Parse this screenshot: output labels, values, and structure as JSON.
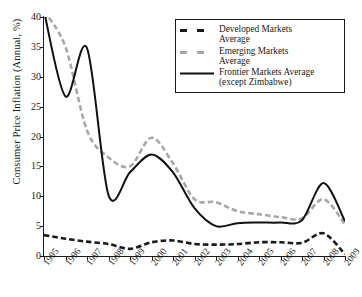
{
  "chart_data": {
    "type": "line",
    "title": "",
    "xlabel": "",
    "ylabel": "Consumer Price Inflation (Annual, %)",
    "grid": false,
    "legend_position": "top-right",
    "xlim": [
      1995,
      2009
    ],
    "ylim": [
      0,
      40
    ],
    "yticks": [
      0,
      5,
      10,
      15,
      20,
      25,
      30,
      35,
      40
    ],
    "categories": [
      "1995",
      "1996",
      "1997",
      "1998",
      "1999",
      "2000",
      "2001",
      "2002",
      "2003",
      "2004",
      "2005",
      "2006",
      "2007",
      "2008",
      "2009"
    ],
    "x": [
      1995,
      1996,
      1997,
      1998,
      1999,
      2000,
      2001,
      2002,
      2003,
      2004,
      2005,
      2006,
      2007,
      2008,
      2009
    ],
    "series": [
      {
        "name": "Developed Markets Average",
        "style": "dashed-dark",
        "color": "#1a1a1a",
        "values": [
          3.5,
          2.9,
          2.4,
          2.0,
          1.2,
          2.3,
          2.6,
          2.0,
          1.9,
          2.0,
          2.3,
          2.3,
          2.2,
          3.8,
          0.3
        ]
      },
      {
        "name": "Emerging Markets Average",
        "style": "dashed-gray",
        "color": "#a8a8a8",
        "values": [
          41.0,
          35.0,
          21.0,
          16.5,
          15.0,
          19.8,
          15.5,
          9.5,
          9.0,
          7.5,
          7.0,
          6.5,
          6.3,
          9.5,
          5.3
        ]
      },
      {
        "name": "Frontier Markets Average (except Zimbabwe)",
        "style": "solid",
        "color": "#111111",
        "values": [
          41.0,
          26.7,
          34.8,
          10.2,
          14.0,
          17.0,
          14.0,
          8.0,
          5.0,
          5.5,
          5.6,
          5.6,
          6.0,
          12.2,
          5.8
        ]
      }
    ]
  },
  "legend": {
    "entries": [
      {
        "line1": "Developed Markets",
        "line2": "Average",
        "sample": "dashed-dark-line-sample"
      },
      {
        "line1": "Emerging Markets",
        "line2": "Average",
        "sample": "dashed-gray-line-sample"
      },
      {
        "line1": "Frontier Markets Average",
        "line2": "(except Zimbabwe)",
        "sample": "solid-line-sample"
      }
    ]
  }
}
